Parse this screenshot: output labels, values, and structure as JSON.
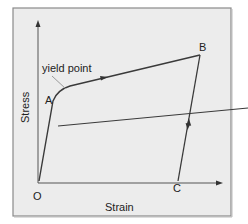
{
  "diagram": {
    "type": "stress-strain curve",
    "axes": {
      "x_label": "Strain",
      "y_label": "Stress"
    },
    "points": {
      "origin": "O",
      "a": "A",
      "b": "B",
      "c": "C"
    },
    "annotations": {
      "yield": "yield point"
    },
    "colors": {
      "background": "#ececec",
      "frame": "#8a8a8a",
      "line": "#3a3a3a",
      "axis": "#555555",
      "leader": "#9a9a9a"
    }
  }
}
